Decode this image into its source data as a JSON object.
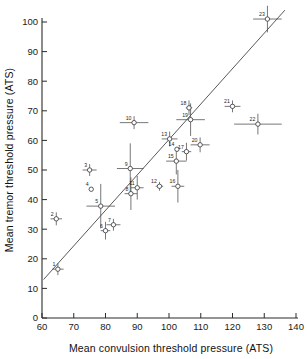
{
  "chart_data": {
    "type": "scatter",
    "title": "",
    "xlabel": "Mean convulsion threshold pressure (ATS)",
    "ylabel": "Mean tremor threshold pressure (ATS)",
    "xlim": [
      60,
      140
    ],
    "ylim": [
      0,
      105
    ],
    "xticks": [
      60,
      70,
      80,
      90,
      100,
      110,
      120,
      130,
      140
    ],
    "yticks": [
      0,
      10,
      20,
      30,
      40,
      50,
      60,
      70,
      80,
      90,
      100
    ],
    "xticklabels": [
      "60",
      "70",
      "80",
      "90",
      "100",
      "110",
      "120",
      "130",
      "140"
    ],
    "yticklabels": [
      "0",
      "10",
      "20",
      "30",
      "40",
      "50",
      "60",
      "70",
      "80",
      "90",
      "100"
    ],
    "grid": false,
    "legend": "none",
    "error_bars": "horizontal and vertical",
    "fit_line": {
      "label": "regression line",
      "x_start": 60.5,
      "y_start": 13.0,
      "x_end": 136.5,
      "y_end": 104.0
    },
    "points": [
      {
        "label": "1",
        "x": 65.0,
        "y": 16.5,
        "xerr": 1.8,
        "yerr": 2.0
      },
      {
        "label": "2",
        "x": 64.5,
        "y": 33.5,
        "xerr": 1.8,
        "yerr": 2.2
      },
      {
        "label": "3",
        "x": 75.0,
        "y": 50.0,
        "xerr": 2.2,
        "yerr": 2.0
      },
      {
        "label": "4",
        "x": 75.5,
        "y": 43.5,
        "xerr": 0.0,
        "yerr": 0.0
      },
      {
        "label": "5",
        "x": 78.5,
        "y": 37.8,
        "xerr": 4.5,
        "yerr": 7.5
      },
      {
        "label": "6",
        "x": 80.0,
        "y": 29.5,
        "xerr": 1.5,
        "yerr": 3.0
      },
      {
        "label": "7",
        "x": 82.5,
        "y": 31.5,
        "xerr": 2.2,
        "yerr": 2.0
      },
      {
        "label": "8",
        "x": 88.0,
        "y": 42.0,
        "xerr": 2.0,
        "yerr": 5.5
      },
      {
        "label": "9",
        "x": 87.8,
        "y": 50.5,
        "xerr": 4.2,
        "yerr": 8.5
      },
      {
        "label": "10",
        "x": 89.0,
        "y": 66.0,
        "xerr": 4.5,
        "yerr": 2.2
      },
      {
        "label": "11",
        "x": 90.0,
        "y": 44.0,
        "xerr": 2.0,
        "yerr": 4.0
      },
      {
        "label": "12",
        "x": 97.0,
        "y": 44.5,
        "xerr": 1.2,
        "yerr": 1.5
      },
      {
        "label": "13",
        "x": 100.2,
        "y": 60.5,
        "xerr": 2.5,
        "yerr": 2.5
      },
      {
        "label": "14",
        "x": 102.5,
        "y": 57.0,
        "xerr": 0.0,
        "yerr": 0.0
      },
      {
        "label": "15",
        "x": 102.3,
        "y": 53.0,
        "xerr": 3.2,
        "yerr": 4.5
      },
      {
        "label": "16",
        "x": 102.8,
        "y": 44.5,
        "xerr": 2.0,
        "yerr": 5.5
      },
      {
        "label": "17",
        "x": 105.5,
        "y": 56.2,
        "xerr": 1.5,
        "yerr": 3.0
      },
      {
        "label": "18",
        "x": 106.3,
        "y": 71.0,
        "xerr": 1.0,
        "yerr": 2.5
      },
      {
        "label": "19",
        "x": 106.8,
        "y": 67.0,
        "xerr": 4.5,
        "yerr": 5.5
      },
      {
        "label": "20",
        "x": 109.8,
        "y": 58.5,
        "xerr": 3.0,
        "yerr": 2.5
      },
      {
        "label": "21",
        "x": 120.0,
        "y": 71.5,
        "xerr": 2.5,
        "yerr": 2.0
      },
      {
        "label": "22",
        "x": 128.0,
        "y": 65.5,
        "xerr": 7.5,
        "yerr": 3.5
      },
      {
        "label": "23",
        "x": 131.0,
        "y": 101.0,
        "xerr": 4.5,
        "yerr": 4.5
      }
    ]
  },
  "axes": {
    "x_title": "Mean convulsion threshold pressure (ATS)",
    "y_title": "Mean tremor threshold pressure (ATS)"
  }
}
